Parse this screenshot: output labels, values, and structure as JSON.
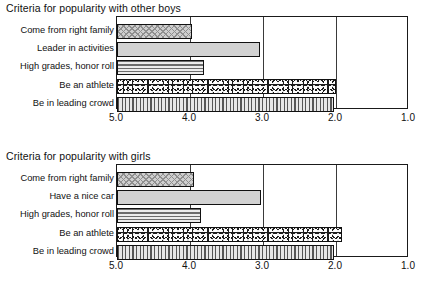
{
  "page": {
    "background_color": "#ffffff",
    "text_color": "#111111"
  },
  "chart_data": [
    {
      "type": "bar",
      "orientation": "horizontal",
      "title": "Criteria for popularity with other boys",
      "xlabel": "",
      "ylabel": "",
      "xlim": [
        5.0,
        1.0
      ],
      "x_reversed": true,
      "grid": "vertical",
      "legend": "none",
      "tick_labels": [
        "5.0",
        "4.0",
        "3.0",
        "2.0",
        "1.0"
      ],
      "tick_values": [
        5.0,
        4.0,
        3.0,
        2.0,
        1.0
      ],
      "categories": [
        "Come from right family",
        "Leader in activities",
        "High grades, honor roll",
        "Be an athlete",
        "Be in leading crowd"
      ],
      "values": [
        3.97,
        3.04,
        3.81,
        2.0,
        2.03
      ],
      "fills": [
        "diagonal-crosshatch",
        "solid-gray",
        "horizontal-lines",
        "speckle",
        "vertical-lines"
      ]
    },
    {
      "type": "bar",
      "orientation": "horizontal",
      "title": "Criteria for popularity with girls",
      "xlabel": "",
      "ylabel": "",
      "xlim": [
        5.0,
        1.0
      ],
      "x_reversed": true,
      "grid": "vertical",
      "legend": "none",
      "tick_labels": [
        "5.0",
        "4.0",
        "3.0",
        "2.0",
        "1.0"
      ],
      "tick_values": [
        5.0,
        4.0,
        3.0,
        2.0,
        1.0
      ],
      "categories": [
        "Come from right family",
        "Have a nice car",
        "High grades, honor roll",
        "Be an athlete",
        "Be in leading crowd"
      ],
      "values": [
        3.95,
        3.03,
        3.85,
        1.92,
        2.03
      ],
      "fills": [
        "diagonal-crosshatch",
        "solid-gray",
        "horizontal-lines",
        "speckle",
        "vertical-lines"
      ]
    }
  ]
}
